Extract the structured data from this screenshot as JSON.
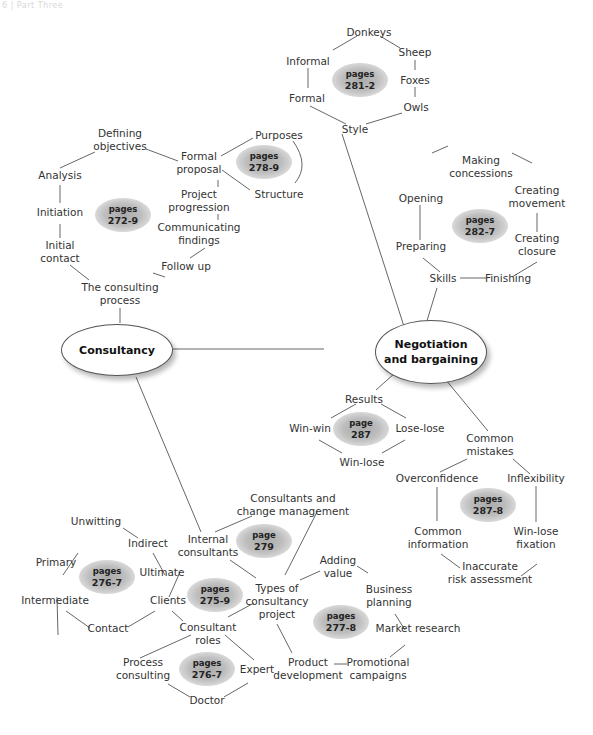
{
  "header": {
    "text": "6 | Part Three"
  },
  "hubs": {
    "consultancy": "Consultancy",
    "negotiation_l1": "Negotiation",
    "negotiation_l2": "and bargaining"
  },
  "page_refs": {
    "style": {
      "l1": "pages",
      "l2": "281-2"
    },
    "proposal": {
      "l1": "pages",
      "l2": "278-9"
    },
    "process": {
      "l1": "pages",
      "l2": "272-9"
    },
    "skills": {
      "l1": "pages",
      "l2": "282-7"
    },
    "results": {
      "l1": "page",
      "l2": "287"
    },
    "mistakes": {
      "l1": "pages",
      "l2": "287-8"
    },
    "internal": {
      "l1": "page",
      "l2": "279"
    },
    "clients_types": {
      "l1": "pages",
      "l2": "276-7"
    },
    "clients": {
      "l1": "pages",
      "l2": "275-9"
    },
    "project_types": {
      "l1": "pages",
      "l2": "277-8"
    },
    "roles": {
      "l1": "pages",
      "l2": "276-7"
    }
  },
  "nodes": {
    "donkeys": "Donkeys",
    "sheep": "Sheep",
    "informal": "Informal",
    "foxes": "Foxes",
    "formal": "Formal",
    "owls": "Owls",
    "style": "Style",
    "defining_l1": "Defining",
    "defining_l2": "objectives",
    "purposes": "Purposes",
    "formal_prop_l1": "Formal",
    "formal_prop_l2": "proposal",
    "structure": "Structure",
    "analysis": "Analysis",
    "project_prog_l1": "Project",
    "project_prog_l2": "progression",
    "initiation": "Initiation",
    "communicating_l1": "Communicating",
    "communicating_l2": "findings",
    "initial_contact_l1": "Initial",
    "initial_contact_l2": "contact",
    "follow_up": "Follow up",
    "consulting_process_l1": "The consulting",
    "consulting_process_l2": "process",
    "making_l1": "Making",
    "making_l2": "concessions",
    "opening": "Opening",
    "creating_mov_l1": "Creating",
    "creating_mov_l2": "movement",
    "preparing": "Preparing",
    "creating_clo_l1": "Creating",
    "creating_clo_l2": "closure",
    "skills": "Skills",
    "finishing": "Finishing",
    "results": "Results",
    "win_win": "Win-win",
    "lose_lose": "Lose-lose",
    "win_lose": "Win-lose",
    "common_mistakes_l1": "Common",
    "common_mistakes_l2": "mistakes",
    "overconfidence": "Overconfidence",
    "inflexibility": "Inflexibility",
    "common_info_l1": "Common",
    "common_info_l2": "information",
    "win_lose_fix_l1": "Win-lose",
    "win_lose_fix_l2": "fixation",
    "inaccurate_l1": "Inaccurate",
    "inaccurate_l2": "risk assessment",
    "consultants_change_l1": "Consultants and",
    "consultants_change_l2": "change management",
    "unwitting": "Unwitting",
    "indirect": "Indirect",
    "internal_l1": "Internal",
    "internal_l2": "consultants",
    "primary": "Primary",
    "ultimate": "Ultimate",
    "adding_l1": "Adding",
    "adding_l2": "value",
    "business_l1": "Business",
    "business_l2": "planning",
    "types_l1": "Types of",
    "types_l2": "consultancy",
    "types_l3": "project",
    "intermediate": "Intermediate",
    "clients": "Clients",
    "contact": "Contact",
    "roles_l1": "Consultant",
    "roles_l2": "roles",
    "market_research": "Market research",
    "process_cons_l1": "Process",
    "process_cons_l2": "consulting",
    "expert": "Expert",
    "product_l1": "Product",
    "product_l2": "development",
    "promo_l1": "Promotional",
    "promo_l2": "campaigns",
    "doctor": "Doctor"
  },
  "colors": {
    "line": "#555555",
    "text": "#333333",
    "blob": "#b5b5b5"
  }
}
